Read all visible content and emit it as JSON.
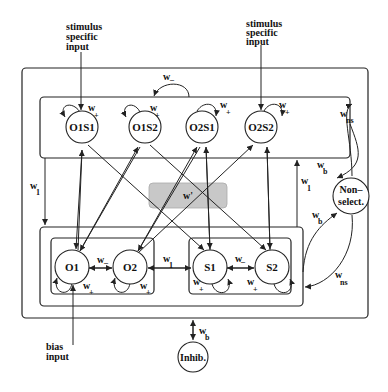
{
  "diagram": {
    "type": "network-architecture",
    "inputs": {
      "stimulus_left": [
        "stimulus",
        "specific",
        "input"
      ],
      "stimulus_right": [
        "stimulus",
        "specific",
        "input"
      ],
      "bias": [
        "bias",
        "input"
      ]
    },
    "top_layer_nodes": [
      {
        "id": "O1S1",
        "label": "O1S1"
      },
      {
        "id": "O1S2",
        "label": "O1S2"
      },
      {
        "id": "O2S1",
        "label": "O2S1"
      },
      {
        "id": "O2S2",
        "label": "O2S2"
      }
    ],
    "bottom_layer_nodes": [
      {
        "id": "O1",
        "label": "O1"
      },
      {
        "id": "O2",
        "label": "O2"
      },
      {
        "id": "S1",
        "label": "S1"
      },
      {
        "id": "S2",
        "label": "S2"
      }
    ],
    "side_nodes": {
      "nonselect": [
        "Non–",
        "select."
      ],
      "inhib": "Inhib."
    },
    "center_box_label": "w'",
    "weights": {
      "w_plus": {
        "base": "w",
        "sub": "+"
      },
      "w_minus": {
        "base": "w",
        "sub": "–"
      },
      "w_1": {
        "base": "w",
        "sub": "1"
      },
      "w_b": {
        "base": "w",
        "sub": "b"
      },
      "w_ns": {
        "base": "w",
        "sub": "ns"
      }
    },
    "colors": {
      "line": "#222222",
      "center_box_fill": "#c8c8c8",
      "background": "#ffffff"
    }
  }
}
